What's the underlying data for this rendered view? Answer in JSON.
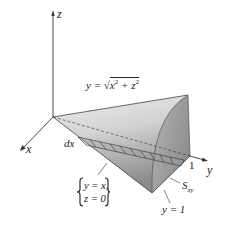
{
  "figure": {
    "type": "3d-solid-diagram",
    "axes": {
      "x_label": "x",
      "y_label": "y",
      "z_label": "z",
      "y_tick": "1"
    },
    "surface_equation": {
      "lhs": "y = ",
      "radical": "x",
      "exp1": "2",
      "plus": " + z",
      "exp2": "2"
    },
    "labels": {
      "dx": "dx",
      "region": "S",
      "region_sub": "xy",
      "plane": "y = 1"
    },
    "edge_condition": {
      "line1": "y = x,",
      "line2": "z = 0"
    },
    "colors": {
      "surface_light": "#e6e6e6",
      "surface_mid": "#bdbdbd",
      "surface_dark": "#7a7a7a",
      "cap_face": "#9a9a9a",
      "strip": "#555555",
      "axis": "#333333"
    }
  }
}
